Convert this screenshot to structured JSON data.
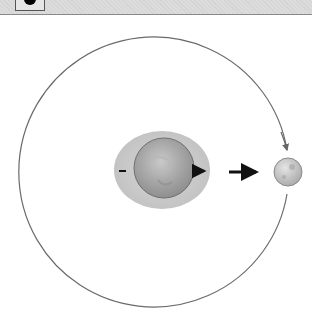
{
  "diagram": {
    "header": {
      "icon": "black-circle-icon"
    },
    "orbit": {
      "cx": 161,
      "cy": 169,
      "r": 135,
      "color": "#6a6a6a"
    },
    "earth": {
      "bulge": {
        "cx": 162,
        "cy": 170,
        "rx": 48,
        "ry": 39,
        "color": "#c8c8c8"
      },
      "globe": {
        "cx": 164,
        "cy": 168,
        "r": 30,
        "color": "#9a9a9a"
      },
      "arrows": [
        {
          "name": "far-side-arrow",
          "x1": 119,
          "y1": 171,
          "x2": 126,
          "y2": 171,
          "size": "small"
        },
        {
          "name": "near-side-arrow",
          "x1": 193,
          "y1": 171,
          "x2": 209,
          "y2": 171,
          "size": "medium"
        }
      ]
    },
    "pull_arrow": {
      "x1": 229,
      "y1": 172,
      "x2": 262,
      "y2": 172
    },
    "moon": {
      "cx": 288,
      "cy": 172,
      "r": 14,
      "color": "#bdbdbd"
    },
    "orbit_arrow": {
      "x": 287,
      "y": 151,
      "direction": "down"
    }
  }
}
